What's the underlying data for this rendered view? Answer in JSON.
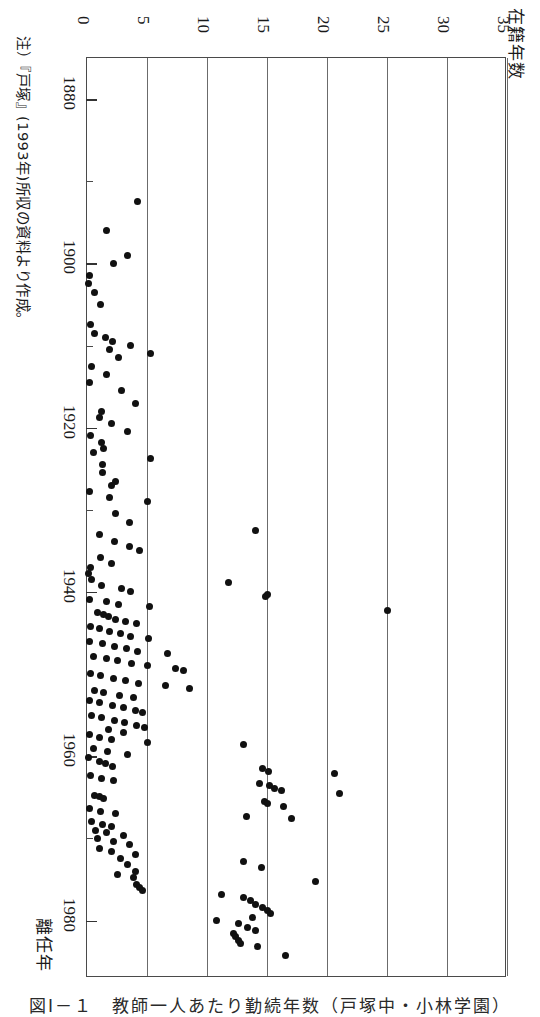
{
  "figure": {
    "caption": "図Ⅰ－１　教師一人あたり勤続年数（戸塚中・小林学園）",
    "note": "注）『戸塚』(1993年)所収の資料より作成。"
  },
  "axes": {
    "value_axis_title": "在籍年数",
    "year_axis_title": "離任年",
    "value_ticks": [
      "0",
      "5",
      "10",
      "15",
      "20",
      "25",
      "30",
      "35"
    ],
    "year_ticks": [
      "1880",
      "1900",
      "1920",
      "1940",
      "1960",
      "1980"
    ]
  },
  "chart_data": {
    "type": "scatter",
    "title": "図Ⅰ－１　教師一人あたり勤続年数（戸塚中・小林学園）",
    "orientation": "rotated-90-clockwise",
    "xlabel": "離任年",
    "ylabel": "在籍年数",
    "xlim": [
      1875,
      1987
    ],
    "ylim": [
      0,
      35
    ],
    "xticks": [
      1880,
      1890,
      1900,
      1910,
      1920,
      1930,
      1940,
      1950,
      1960,
      1970,
      1980
    ],
    "xticklabels": [
      1880,
      1900,
      1920,
      1940,
      1960,
      1980
    ],
    "yticks": [
      0,
      5,
      10,
      15,
      20,
      25,
      30,
      35
    ],
    "grid": "vertical-only",
    "legend": null,
    "marker": "filled-circle",
    "points": [
      [
        1892.5,
        4.2
      ],
      [
        1896.0,
        1.6
      ],
      [
        1899.0,
        3.4
      ],
      [
        1900.0,
        2.2
      ],
      [
        1901.5,
        0.2
      ],
      [
        1902.5,
        0.1
      ],
      [
        1903.5,
        0.6
      ],
      [
        1905.0,
        1.1
      ],
      [
        1907.5,
        0.3
      ],
      [
        1908.5,
        0.6
      ],
      [
        1909.0,
        1.5
      ],
      [
        1909.5,
        2.1
      ],
      [
        1910.0,
        3.6
      ],
      [
        1910.5,
        1.9
      ],
      [
        1911.0,
        5.3
      ],
      [
        1911.5,
        2.6
      ],
      [
        1912.5,
        0.4
      ],
      [
        1913.5,
        1.6
      ],
      [
        1914.5,
        0.2
      ],
      [
        1915.5,
        2.9
      ],
      [
        1917.0,
        4.0
      ],
      [
        1918.0,
        1.2
      ],
      [
        1918.8,
        1.0
      ],
      [
        1919.5,
        2.0
      ],
      [
        1920.5,
        3.4
      ],
      [
        1921.0,
        0.3
      ],
      [
        1921.8,
        1.2
      ],
      [
        1922.5,
        1.4
      ],
      [
        1923.0,
        0.5
      ],
      [
        1923.8,
        5.3
      ],
      [
        1924.5,
        1.3
      ],
      [
        1925.5,
        1.3
      ],
      [
        1926.5,
        2.4
      ],
      [
        1927.0,
        2.0
      ],
      [
        1927.8,
        0.2
      ],
      [
        1928.5,
        1.9
      ],
      [
        1929.0,
        5.0
      ],
      [
        1930.5,
        2.4
      ],
      [
        1931.5,
        3.5
      ],
      [
        1932.5,
        14.0
      ],
      [
        1933.0,
        1.0
      ],
      [
        1933.8,
        2.3
      ],
      [
        1934.5,
        3.5
      ],
      [
        1935.0,
        4.4
      ],
      [
        1935.8,
        1.1
      ],
      [
        1936.5,
        2.0
      ],
      [
        1937.0,
        0.3
      ],
      [
        1937.8,
        0.1
      ],
      [
        1938.5,
        0.4
      ],
      [
        1938.8,
        11.8
      ],
      [
        1939.2,
        1.2
      ],
      [
        1939.6,
        2.9
      ],
      [
        1940.0,
        3.6
      ],
      [
        1940.3,
        15.0
      ],
      [
        1940.6,
        14.9
      ],
      [
        1940.9,
        0.2
      ],
      [
        1941.2,
        1.6
      ],
      [
        1941.5,
        2.6
      ],
      [
        1941.8,
        5.2
      ],
      [
        1942.2,
        25.0
      ],
      [
        1942.5,
        0.9
      ],
      [
        1942.8,
        1.4
      ],
      [
        1943.0,
        1.8
      ],
      [
        1943.3,
        2.4
      ],
      [
        1943.6,
        3.2
      ],
      [
        1943.9,
        4.1
      ],
      [
        1944.2,
        0.3
      ],
      [
        1944.5,
        1.0
      ],
      [
        1944.8,
        1.9
      ],
      [
        1945.1,
        2.8
      ],
      [
        1945.4,
        3.6
      ],
      [
        1945.7,
        5.1
      ],
      [
        1946.0,
        0.2
      ],
      [
        1946.3,
        1.3
      ],
      [
        1946.6,
        2.3
      ],
      [
        1946.9,
        3.3
      ],
      [
        1947.2,
        4.2
      ],
      [
        1947.5,
        6.7
      ],
      [
        1947.8,
        0.5
      ],
      [
        1948.1,
        1.6
      ],
      [
        1948.4,
        2.5
      ],
      [
        1948.7,
        3.7
      ],
      [
        1949.0,
        5.0
      ],
      [
        1949.3,
        7.4
      ],
      [
        1949.6,
        8.0
      ],
      [
        1949.9,
        0.3
      ],
      [
        1950.2,
        1.1
      ],
      [
        1950.5,
        2.2
      ],
      [
        1950.8,
        3.2
      ],
      [
        1951.1,
        4.3
      ],
      [
        1951.4,
        6.5
      ],
      [
        1951.7,
        8.5
      ],
      [
        1952.0,
        0.6
      ],
      [
        1952.3,
        1.4
      ],
      [
        1952.6,
        2.7
      ],
      [
        1952.9,
        3.9
      ],
      [
        1953.2,
        0.2
      ],
      [
        1953.5,
        1.0
      ],
      [
        1953.8,
        2.1
      ],
      [
        1954.1,
        3.0
      ],
      [
        1954.4,
        4.0
      ],
      [
        1954.7,
        4.6
      ],
      [
        1955.0,
        0.4
      ],
      [
        1955.3,
        1.2
      ],
      [
        1955.6,
        2.3
      ],
      [
        1955.9,
        3.1
      ],
      [
        1956.2,
        4.1
      ],
      [
        1956.5,
        4.8
      ],
      [
        1956.8,
        1.8
      ],
      [
        1957.1,
        3.0
      ],
      [
        1957.4,
        0.2
      ],
      [
        1957.7,
        1.0
      ],
      [
        1958.0,
        2.0
      ],
      [
        1958.3,
        5.0
      ],
      [
        1958.6,
        13.0
      ],
      [
        1959.0,
        0.5
      ],
      [
        1959.4,
        1.7
      ],
      [
        1959.8,
        3.4
      ],
      [
        1960.2,
        0.1
      ],
      [
        1960.6,
        1.0
      ],
      [
        1960.9,
        1.5
      ],
      [
        1961.2,
        2.1
      ],
      [
        1961.5,
        14.6
      ],
      [
        1961.8,
        15.1
      ],
      [
        1962.1,
        20.6
      ],
      [
        1962.4,
        0.3
      ],
      [
        1962.7,
        1.2
      ],
      [
        1963.0,
        2.2
      ],
      [
        1963.3,
        14.4
      ],
      [
        1963.6,
        15.2
      ],
      [
        1963.9,
        15.6
      ],
      [
        1964.2,
        16.2
      ],
      [
        1964.5,
        21.0
      ],
      [
        1964.8,
        0.6
      ],
      [
        1964.9,
        1.0
      ],
      [
        1965.2,
        1.4
      ],
      [
        1965.5,
        14.8
      ],
      [
        1965.8,
        15.0
      ],
      [
        1966.1,
        16.4
      ],
      [
        1966.4,
        0.2
      ],
      [
        1966.7,
        1.1
      ],
      [
        1967.0,
        2.4
      ],
      [
        1967.3,
        13.3
      ],
      [
        1967.6,
        17.0
      ],
      [
        1968.0,
        0.4
      ],
      [
        1968.3,
        1.3
      ],
      [
        1968.6,
        2.0
      ],
      [
        1969.0,
        0.7
      ],
      [
        1969.3,
        1.6
      ],
      [
        1969.6,
        3.0
      ],
      [
        1970.0,
        0.9
      ],
      [
        1970.4,
        2.2
      ],
      [
        1970.8,
        3.5
      ],
      [
        1971.2,
        1.0
      ],
      [
        1971.6,
        2.0
      ],
      [
        1972.0,
        4.0
      ],
      [
        1972.4,
        2.8
      ],
      [
        1972.8,
        13.0
      ],
      [
        1973.2,
        3.4
      ],
      [
        1973.6,
        14.5
      ],
      [
        1974.0,
        4.0
      ],
      [
        1974.4,
        2.5
      ],
      [
        1974.8,
        3.9
      ],
      [
        1975.2,
        19.0
      ],
      [
        1975.6,
        4.1
      ],
      [
        1976.0,
        4.4
      ],
      [
        1976.4,
        4.6
      ],
      [
        1976.8,
        11.2
      ],
      [
        1977.2,
        13.0
      ],
      [
        1977.6,
        13.6
      ],
      [
        1978.0,
        14.0
      ],
      [
        1978.4,
        14.6
      ],
      [
        1978.8,
        15.0
      ],
      [
        1979.2,
        15.3
      ],
      [
        1979.6,
        13.8
      ],
      [
        1980.0,
        10.8
      ],
      [
        1980.4,
        12.6
      ],
      [
        1980.8,
        13.4
      ],
      [
        1981.2,
        14.0
      ],
      [
        1981.6,
        12.2
      ],
      [
        1982.0,
        12.4
      ],
      [
        1982.4,
        12.6
      ],
      [
        1982.8,
        12.8
      ],
      [
        1983.2,
        14.2
      ],
      [
        1984.2,
        16.5
      ]
    ]
  }
}
